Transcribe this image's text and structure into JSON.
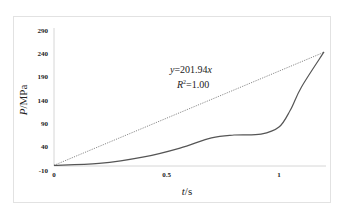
{
  "chart_data": {
    "type": "line",
    "title": "",
    "xlabel": "t/s",
    "ylabel": "P/MPa",
    "xlim": [
      0,
      1.2
    ],
    "ylim": [
      -10,
      290
    ],
    "x_ticks": [
      "0",
      "0.5",
      "1"
    ],
    "y_ticks": [
      "290",
      "240",
      "190",
      "140",
      "90",
      "40",
      "-10"
    ],
    "grid": false,
    "legend": null,
    "series": [
      {
        "name": "P(t) measured",
        "style": "solid",
        "color": "#555555",
        "x": [
          0,
          0.2,
          0.4,
          0.56,
          0.7,
          0.8,
          0.92,
          1.0,
          1.05,
          1.1,
          1.2
        ],
        "values": [
          0,
          4,
          18,
          37,
          59,
          65,
          67,
          82,
          118,
          168,
          243
        ]
      },
      {
        "name": "Linear fit",
        "style": "dotted",
        "color": "#888888",
        "x": [
          0,
          1.2
        ],
        "values": [
          0,
          242.3
        ]
      }
    ],
    "annotations": [
      {
        "text": "y=201.94x"
      },
      {
        "text": "R²=1.00"
      }
    ]
  },
  "labels": {
    "xlabel_italic": "t",
    "xlabel_rest": "/s",
    "ylabel_italic": "P",
    "ylabel_rest": "/MPa",
    "eq_italic_y": "y",
    "eq_rest": "=201.94",
    "eq_italic_x": "x",
    "r2_italic": "R",
    "r2_sup": "2",
    "r2_rest": "=1.00"
  }
}
